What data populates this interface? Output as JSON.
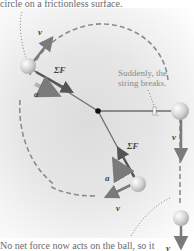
{
  "captions": {
    "top": "circle on a frictionless surface.",
    "bottom": "No net force now acts on the ball, so it",
    "note_line1": "Suddenly, the",
    "note_line2": "string breaks."
  },
  "labels": {
    "v": "v⃗",
    "a": "a⃗",
    "sum_f": "ΣF⃗"
  },
  "colors": {
    "arrow": "#7a7a7a",
    "string": "#6e6e6e",
    "path": "#8c8c8c",
    "ball": "#d2d2d2",
    "center": "#111111",
    "caption": "#6a6a6a"
  }
}
